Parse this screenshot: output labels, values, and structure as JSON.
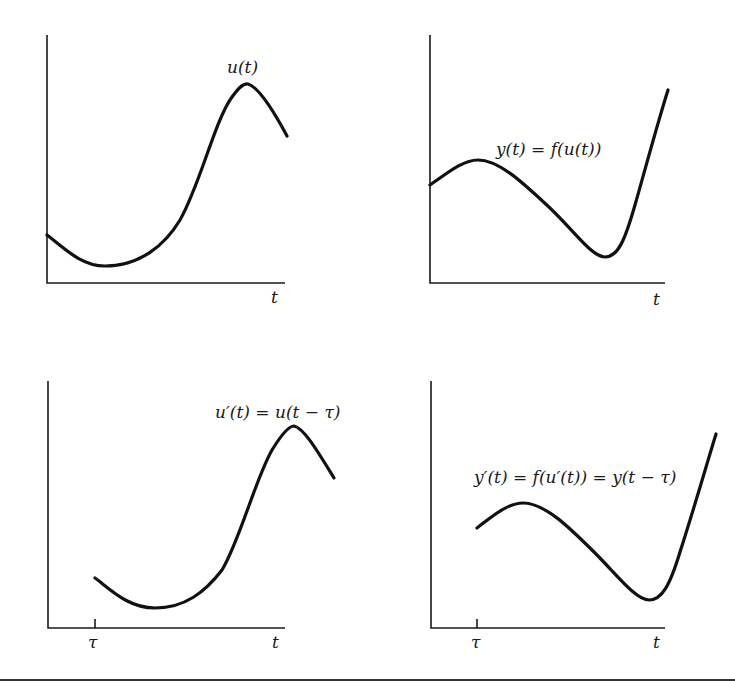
{
  "figure": {
    "panels": [
      {
        "id": "top-left",
        "curve_label": "u(t)",
        "x_axis_label": "t",
        "tick_label": ""
      },
      {
        "id": "top-right",
        "curve_label": "y(t) = f(u(t))",
        "x_axis_label": "t",
        "tick_label": ""
      },
      {
        "id": "bottom-left",
        "curve_label": "u′(t) = u(t − τ)",
        "x_axis_label": "t",
        "tick_label": "τ"
      },
      {
        "id": "bottom-right",
        "curve_label": "y′(t) = f(u′(t)) = y(t − τ)",
        "x_axis_label": "t",
        "tick_label": "τ"
      }
    ],
    "colors": {
      "curve": "#111111",
      "axis": "#1a1a1a",
      "background": "#ffffff"
    }
  }
}
